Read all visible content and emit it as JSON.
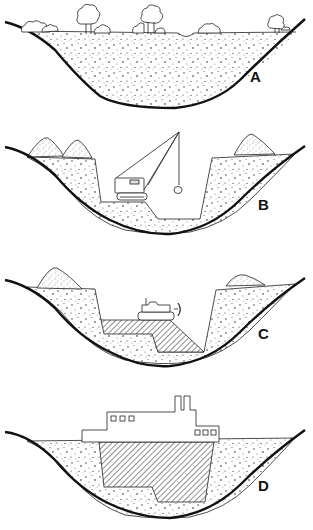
{
  "figure": {
    "panels": [
      {
        "id": "A",
        "label": "A",
        "description": "Natural valley filled with sediment, trees on surface"
      },
      {
        "id": "B",
        "label": "B",
        "description": "Excavation with dragline crane, spoil heaps on banks"
      },
      {
        "id": "C",
        "label": "C",
        "description": "Fill placed in excavation, bulldozer spreading material"
      },
      {
        "id": "D",
        "label": "D",
        "description": "Completed structure (building) founded on compacted fill"
      }
    ]
  },
  "colors": {
    "line": "#111111",
    "background": "#ffffff",
    "stipple": "#333333"
  }
}
